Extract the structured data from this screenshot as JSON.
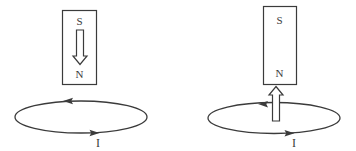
{
  "figure": {
    "background_color": "#ffffff",
    "line_color": "#3b3b3b",
    "panels": [
      {
        "name": "left-diagram",
        "magnet": {
          "top_pole_label": "S",
          "bottom_pole_label": "N"
        },
        "motion_arrow": {
          "icon": "arrow-down-icon",
          "direction": "down",
          "style": "hollow-outline",
          "position": "inside-magnet"
        },
        "loop": {
          "current_label": "I",
          "top_arrowhead": {
            "icon": "arrowhead-left-icon",
            "direction": "left"
          },
          "bottom_arrowhead": {
            "icon": "arrowhead-right-icon",
            "direction": "right"
          }
        }
      },
      {
        "name": "right-diagram",
        "magnet": {
          "top_pole_label": "S",
          "bottom_pole_label": "N"
        },
        "motion_arrow": {
          "icon": "arrow-up-icon",
          "direction": "up",
          "style": "hollow-outline",
          "position": "between-magnet-and-loop"
        },
        "loop": {
          "current_label": "I",
          "top_arrowhead": {
            "icon": "arrowhead-left-icon",
            "direction": "left"
          },
          "bottom_arrowhead": {
            "icon": "arrowhead-right-icon",
            "direction": "right"
          }
        }
      }
    ]
  }
}
